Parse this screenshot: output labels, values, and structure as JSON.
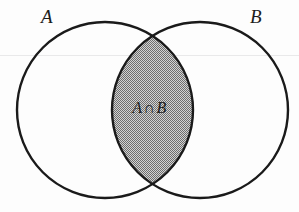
{
  "diagram": {
    "type": "venn",
    "title": "",
    "sets": [
      {
        "id": "A",
        "label": "A",
        "position": "left"
      },
      {
        "id": "B",
        "label": "B",
        "position": "right"
      }
    ],
    "regions": [
      {
        "id": "intersection",
        "label_a": "A",
        "operator": "∩",
        "label_b": "B",
        "shaded": true,
        "fill": "#a0a0a0",
        "pattern": "checkerboard-dither"
      }
    ],
    "stroke_color": "#1a1a1a",
    "background_color": "#fdfdfd",
    "shade_color": "#a0a0a0"
  }
}
